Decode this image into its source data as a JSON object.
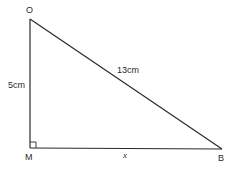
{
  "diagram": {
    "type": "right-triangle",
    "vertices": {
      "O": {
        "label": "O",
        "x": 30,
        "y": 19
      },
      "M": {
        "label": "M",
        "x": 30,
        "y": 148
      },
      "B": {
        "label": "B",
        "x": 222,
        "y": 149
      }
    },
    "sides": {
      "OM": {
        "label": "5cm"
      },
      "OB": {
        "label": "13cm"
      },
      "MB": {
        "label": "x"
      }
    },
    "right_angle_at": "M",
    "colors": {
      "stroke": "#2a2a2a",
      "background": "#ffffff"
    }
  }
}
